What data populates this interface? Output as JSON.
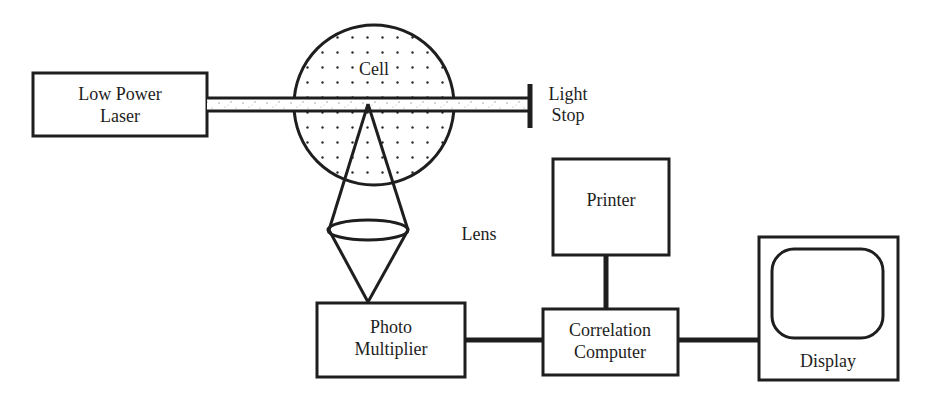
{
  "diagram": {
    "type": "block-diagram",
    "components": {
      "laser": {
        "label_line1": "Low Power",
        "label_line2": "Laser"
      },
      "cell": {
        "label": "Cell"
      },
      "stop": {
        "label_line1": "Light",
        "label_line2": "Stop"
      },
      "lens": {
        "label": "Lens"
      },
      "pm": {
        "label_line1": "Photo",
        "label_line2": "Multiplier"
      },
      "printer": {
        "label": "Printer"
      },
      "corr": {
        "label_line1": "Correlation",
        "label_line2": "Computer"
      },
      "display": {
        "label": "Display"
      }
    },
    "connections": [
      {
        "from": "Low Power Laser",
        "to": "Cell",
        "kind": "laser beam"
      },
      {
        "from": "Cell",
        "to": "Light Stop",
        "kind": "laser beam"
      },
      {
        "from": "Cell",
        "to": "Lens",
        "kind": "scattered light cone"
      },
      {
        "from": "Lens",
        "to": "Photo Multiplier",
        "kind": "focused light cone"
      },
      {
        "from": "Photo Multiplier",
        "to": "Correlation Computer",
        "kind": "signal"
      },
      {
        "from": "Correlation Computer",
        "to": "Printer",
        "kind": "signal"
      },
      {
        "from": "Correlation Computer",
        "to": "Display",
        "kind": "signal"
      }
    ],
    "colors": {
      "ink": "#1e1e1e",
      "background": "#ffffff",
      "speckle": "#8a8a8a"
    }
  }
}
